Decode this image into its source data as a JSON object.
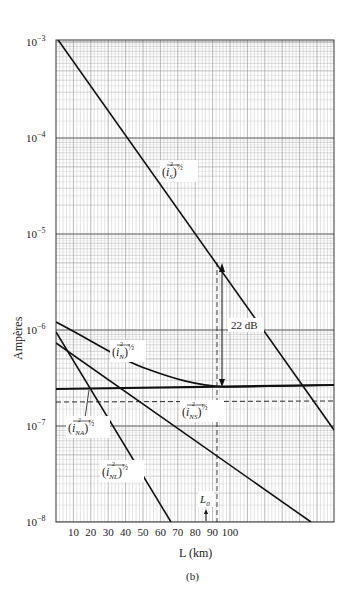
{
  "chart_data": {
    "type": "line",
    "title": "",
    "subtitle": "(b)",
    "xlabel": "L (km)",
    "ylabel": "Ampères",
    "yscale": "log",
    "ylim": [
      1e-08,
      0.001
    ],
    "xlim": [
      0,
      160
    ],
    "grid": true,
    "x_ticks": [
      "10",
      "20",
      "30",
      "40",
      "50",
      "60",
      "70",
      "80",
      "90",
      "100"
    ],
    "y_ticks": [
      "10^-3",
      "10^-4",
      "10^-5",
      "10^-6",
      "10^-7",
      "10^-8"
    ],
    "series": [
      {
        "name": "(i_S^2)^1/2",
        "style": "solid",
        "x": [
          0,
          160
        ],
        "y": [
          0.0011,
          9e-08
        ]
      },
      {
        "name": "(i_N^2)^1/2",
        "style": "solid-curve",
        "x": [
          0,
          20,
          40,
          60,
          90,
          160
        ],
        "y": [
          1.25e-06,
          7e-07,
          4.5e-07,
          3.3e-07,
          2.6e-07,
          2.6e-07
        ]
      },
      {
        "name": "(i_NA^2)^1/2",
        "style": "thick-horizontal",
        "x": [
          0,
          160
        ],
        "y": [
          2.6e-07,
          2.6e-07
        ]
      },
      {
        "name": "(i_NS^2)^1/2",
        "style": "solid",
        "x": [
          0,
          145
        ],
        "y": [
          8e-07,
          1e-08
        ]
      },
      {
        "name": "(i_NL^2)^1/2",
        "style": "solid",
        "x": [
          0,
          66
        ],
        "y": [
          1e-06,
          1e-08
        ]
      },
      {
        "name": "reference",
        "style": "dashed-horizontal",
        "x": [
          0,
          160
        ],
        "y": [
          1.8e-07,
          1.8e-07
        ]
      }
    ],
    "annotations": [
      {
        "text": "22 dB",
        "type": "double-arrow",
        "x": 90,
        "y_from": 2.6e-07,
        "y_to": 4.3e-06
      },
      {
        "text": "L0",
        "type": "marker",
        "x": 88
      }
    ]
  },
  "labels": {
    "ylabel": "Ampères",
    "xlabel": "L (km)",
    "caption": "(b)",
    "db": "22 dB",
    "l0": "L",
    "l0_sub": "0",
    "iS": "i",
    "iS_sub": "S",
    "iN": "i",
    "iN_sub": "N",
    "iNA": "i",
    "iNA_sub": "NA",
    "iNS": "i",
    "iNS_sub": "NS",
    "iNL": "i",
    "iNL_sub": "NL",
    "half": "½"
  },
  "ticks": {
    "x": [
      "10",
      "20",
      "30",
      "40",
      "50",
      "60",
      "70",
      "80",
      "90",
      "100"
    ],
    "y_exp": [
      "−3",
      "−4",
      "−5",
      "−6",
      "−7",
      "−8"
    ],
    "y_base": "10"
  }
}
